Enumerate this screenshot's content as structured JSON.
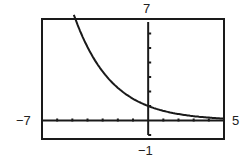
{
  "chart_data": {
    "type": "line",
    "title": "",
    "xlabel": "",
    "ylabel": "",
    "window": {
      "xmin": -7,
      "xmax": 5,
      "ymin": -1,
      "ymax": 7,
      "xscl": 1,
      "yscl": 1
    },
    "xlim": [
      -7,
      5
    ],
    "ylim": [
      -1,
      7
    ],
    "grid": false,
    "legend": null,
    "tick_labels": {
      "left": "−7",
      "right": "5",
      "top": "7",
      "bottom": "−1"
    },
    "series": [
      {
        "name": "exponential decay",
        "description": "Decreasing exponential curve, y-intercept ≈ 1, approaching x-axis as x → 5",
        "x": [
          -4.9,
          -4,
          -3.4,
          -3,
          -2,
          -1,
          0,
          1,
          2,
          3,
          4,
          5
        ],
        "y": [
          7.0,
          4.95,
          3.96,
          3.38,
          2.25,
          1.5,
          1.0,
          0.67,
          0.44,
          0.3,
          0.2,
          0.13
        ]
      }
    ]
  },
  "labels": {
    "ymax": "7",
    "xmin": "−7",
    "xmax": "5",
    "ymin": "−1"
  },
  "colors": {
    "frame": "#1a1a1a",
    "curve": "#1a1a1a",
    "background": "#ffffff"
  }
}
